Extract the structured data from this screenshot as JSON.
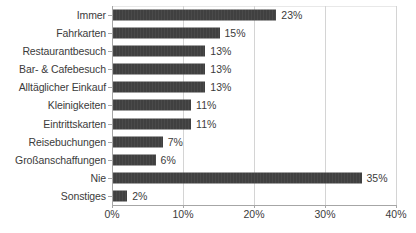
{
  "chart_data": {
    "type": "bar",
    "orientation": "horizontal",
    "title": "",
    "subtitle": "",
    "xlabel": "",
    "ylabel": "",
    "xlim": [
      0,
      40
    ],
    "xtick_labels": [
      "0%",
      "10%",
      "20%",
      "30%",
      "40%"
    ],
    "xtick_values": [
      0,
      10,
      20,
      30,
      40
    ],
    "grid": true,
    "legend": false,
    "value_label_suffix": "%",
    "bar_color": "#404040",
    "gridline_color": "#d4d4d4",
    "axis_color": "#a6a6a6",
    "text_color": "#3b3b3b",
    "categories": [
      "Immer",
      "Fahrkarten",
      "Restaurantbesuch",
      "Bar- & Cafebesuch",
      "Alltäglicher Einkauf",
      "Kleinigkeiten",
      "Eintrittskarten",
      "Reisebuchungen",
      "Großanschaffungen",
      "Nie",
      "Sonstiges"
    ],
    "values": [
      23,
      15,
      13,
      13,
      13,
      11,
      11,
      7,
      6,
      35,
      2
    ],
    "value_labels": [
      "23%",
      "15%",
      "13%",
      "13%",
      "13%",
      "11%",
      "11%",
      "7%",
      "6%",
      "35%",
      "2%"
    ],
    "bars": [
      {
        "category": "Immer",
        "value": 23,
        "label": "23%"
      },
      {
        "category": "Fahrkarten",
        "value": 15,
        "label": "15%"
      },
      {
        "category": "Restaurantbesuch",
        "value": 13,
        "label": "13%"
      },
      {
        "category": "Bar- & Cafebesuch",
        "value": 13,
        "label": "13%"
      },
      {
        "category": "Alltäglicher Einkauf",
        "value": 13,
        "label": "13%"
      },
      {
        "category": "Kleinigkeiten",
        "value": 11,
        "label": "11%"
      },
      {
        "category": "Eintrittskarten",
        "value": 11,
        "label": "11%"
      },
      {
        "category": "Reisebuchungen",
        "value": 7,
        "label": "7%"
      },
      {
        "category": "Großanschaffungen",
        "value": 6,
        "label": "6%"
      },
      {
        "category": "Nie",
        "value": 35,
        "label": "35%"
      },
      {
        "category": "Sonstiges",
        "value": 2,
        "label": "2%"
      }
    ]
  }
}
